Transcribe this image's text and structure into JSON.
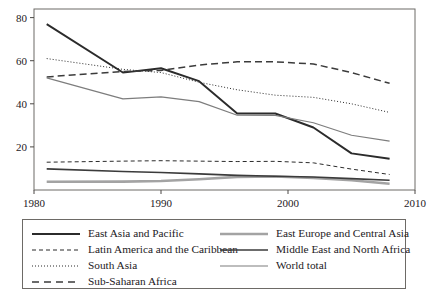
{
  "chart_data": {
    "type": "line",
    "title": "",
    "xlabel": "",
    "ylabel": "",
    "xlim": [
      1980,
      2010
    ],
    "ylim": [
      0,
      84
    ],
    "xticks": [
      1980,
      1990,
      2000,
      2010
    ],
    "yticks": [
      20,
      40,
      60,
      80
    ],
    "grid": false,
    "legend_position": "below",
    "x": [
      1981,
      1987,
      1990,
      1993,
      1996,
      1999,
      2002,
      2005,
      2008
    ],
    "series": [
      {
        "name": "East Asia and Pacific",
        "style": "solid",
        "color": "#2b2b2b",
        "width": 1.9,
        "values": [
          77.0,
          54.5,
          56.5,
          50.5,
          35.5,
          35.5,
          29.0,
          17.0,
          14.5
        ]
      },
      {
        "name": "Latin America and the Caribbean",
        "style": "dashed",
        "color": "#2b2b2b",
        "width": 1.0,
        "values": [
          12.9,
          13.4,
          13.6,
          13.4,
          13.2,
          13.3,
          12.6,
          9.7,
          7.2
        ]
      },
      {
        "name": "South Asia",
        "style": "dotted",
        "color": "#2b2b2b",
        "width": 1.0,
        "values": [
          61.0,
          56.0,
          54.5,
          50.0,
          46.5,
          44.0,
          43.0,
          40.0,
          36.0
        ]
      },
      {
        "name": "Sub-Saharan Africa",
        "style": "longdash",
        "color": "#3b3b3b",
        "width": 1.5,
        "values": [
          52.5,
          55.0,
          55.5,
          58.0,
          59.5,
          59.5,
          58.5,
          54.5,
          49.5
        ]
      },
      {
        "name": "East Europe and Central Asia",
        "style": "solid",
        "color": "#a3a3a3",
        "width": 2.6,
        "values": [
          3.8,
          3.9,
          4.2,
          5.0,
          6.1,
          6.3,
          5.6,
          4.5,
          2.9
        ]
      },
      {
        "name": "Middle East and North Africa",
        "style": "solid",
        "color": "#3b3b3b",
        "width": 1.6,
        "values": [
          9.8,
          8.6,
          8.1,
          7.5,
          6.8,
          6.4,
          6.0,
          5.3,
          4.5
        ]
      },
      {
        "name": "World total",
        "style": "solid",
        "color": "#7d7d7d",
        "width": 1.2,
        "values": [
          52.0,
          42.3,
          43.2,
          41.0,
          34.7,
          34.6,
          31.2,
          25.4,
          22.7
        ]
      }
    ]
  },
  "axis": {
    "x_tick_labels": [
      "1980",
      "1990",
      "2000",
      "2010"
    ],
    "y_tick_labels": [
      "20",
      "40",
      "60",
      "80"
    ]
  },
  "legend": {
    "left_column": [
      {
        "label": "East Asia and Pacific",
        "sample": "solid-dark-thick"
      },
      {
        "label": "Latin America and the Caribbean",
        "sample": "dashed-dark"
      },
      {
        "label": "South Asia",
        "sample": "dotted-dark"
      },
      {
        "label": "Sub-Saharan Africa",
        "sample": "longdash-dark"
      }
    ],
    "right_column": [
      {
        "label": "East Europe and Central Asia",
        "sample": "solid-lightgray-thick"
      },
      {
        "label": "Middle East and North Africa",
        "sample": "solid-dark-medium"
      },
      {
        "label": "World total",
        "sample": "solid-gray-thin"
      }
    ]
  }
}
